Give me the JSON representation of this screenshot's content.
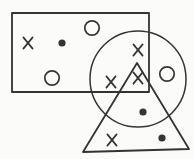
{
  "canvas": {
    "width": 194,
    "height": 159,
    "background": "#fbfbfa",
    "stroke_color": "#343434"
  },
  "diagram": {
    "shapes": [
      {
        "name": "rectangle-outline",
        "type": "rect",
        "x": 12,
        "y": 13,
        "width": 137,
        "height": 79,
        "stroke_width": 1.8
      },
      {
        "name": "circle-outline",
        "type": "circle",
        "cx": 138,
        "cy": 79,
        "r": 48,
        "stroke_width": 1.5
      },
      {
        "name": "triangle-outline",
        "type": "polygon",
        "points": [
          [
            137,
            63
          ],
          [
            83,
            152
          ],
          [
            189,
            149
          ]
        ],
        "stroke_width": 1.8
      }
    ],
    "symbol_sizes": {
      "x_half_width": 4.6,
      "x_half_height": 5.6,
      "x_stroke_width": 1.7,
      "dot_radius": 3.6,
      "ring_radius": 7.2,
      "ring_stroke_width": 1.7
    },
    "symbols": [
      {
        "type": "x",
        "x": 28,
        "y": 43,
        "region": "rectangle"
      },
      {
        "type": "dot",
        "x": 62,
        "y": 43,
        "region": "rectangle"
      },
      {
        "type": "ring",
        "x": 92,
        "y": 28,
        "region": "rectangle"
      },
      {
        "type": "ring",
        "x": 52,
        "y": 78,
        "region": "rectangle"
      },
      {
        "type": "x",
        "x": 138,
        "y": 50,
        "region": "rectangle-circle"
      },
      {
        "type": "x",
        "x": 111,
        "y": 82,
        "region": "rectangle-circle"
      },
      {
        "type": "x",
        "x": 138,
        "y": 78,
        "region": "rectangle-circle-triangle"
      },
      {
        "type": "ring",
        "x": 167,
        "y": 74,
        "region": "circle"
      },
      {
        "type": "dot",
        "x": 143,
        "y": 112,
        "region": "circle-triangle"
      },
      {
        "type": "x",
        "x": 112,
        "y": 140,
        "region": "triangle"
      },
      {
        "type": "dot",
        "x": 162,
        "y": 138,
        "region": "triangle"
      }
    ],
    "counts": {
      "x_marks": 5,
      "filled_dots": 3,
      "open_rings": 3
    }
  }
}
